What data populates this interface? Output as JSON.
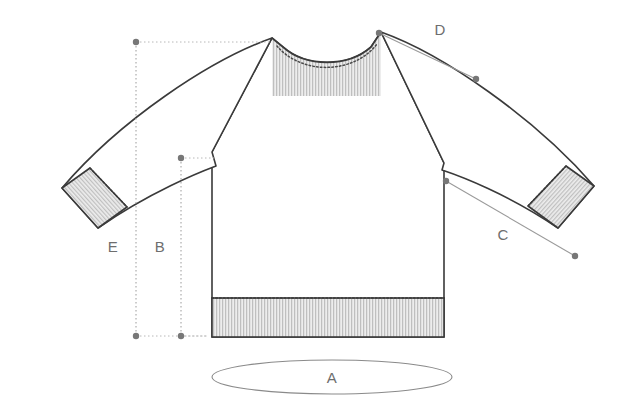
{
  "diagram": {
    "background_color": "#ffffff",
    "outline_color": "#3a3a3a",
    "rib_fill_color": "#e8e8e8",
    "rib_line_color": "#9a9a9a",
    "dotted_guide_color": "#b8b8b8",
    "label_color": "#6e6e6e",
    "measure_line_color": "#8a8a8a",
    "dot_color": "#777777"
  },
  "measurements": [
    {
      "id": "A",
      "label": "A",
      "name": "bottom-width-ellipse",
      "annotation_shape": "ellipse",
      "label_x": 332,
      "label_y": 383,
      "ellipse_cx": 332,
      "ellipse_cy": 377,
      "ellipse_rx": 120,
      "ellipse_ry": 17
    },
    {
      "id": "B",
      "label": "B",
      "name": "body-length-from-armhole",
      "annotation_shape": "vertical-line",
      "label_x": 160,
      "label_y": 252,
      "x": 181,
      "y_top": 158,
      "y_bottom": 336,
      "leader_to_x": 212,
      "leader_to_y": 158
    },
    {
      "id": "C",
      "label": "C",
      "name": "lower-sleeve-length",
      "annotation_shape": "diagonal-line",
      "label_x": 503,
      "label_y": 240,
      "x1": 446,
      "y1": 181,
      "x2": 575,
      "y2": 256
    },
    {
      "id": "D",
      "label": "D",
      "name": "upper-sleeve-length",
      "annotation_shape": "diagonal-line",
      "label_x": 440,
      "label_y": 35,
      "x1": 379,
      "y1": 33,
      "x2": 476,
      "y2": 79
    },
    {
      "id": "E",
      "label": "E",
      "name": "full-length-from-shoulder",
      "annotation_shape": "vertical-line",
      "label_x": 113,
      "label_y": 252,
      "x": 136,
      "y_top": 42,
      "y_bottom": 336,
      "leader_to_x": 270,
      "leader_to_y": 42
    }
  ],
  "garment_parts": [
    {
      "name": "body-panel",
      "ribbed": false
    },
    {
      "name": "left-sleeve",
      "ribbed": false
    },
    {
      "name": "right-sleeve",
      "ribbed": false
    },
    {
      "name": "collar-rib",
      "ribbed": true
    },
    {
      "name": "left-cuff-rib",
      "ribbed": true
    },
    {
      "name": "right-cuff-rib",
      "ribbed": true
    },
    {
      "name": "bottom-hem-rib",
      "ribbed": true
    }
  ]
}
